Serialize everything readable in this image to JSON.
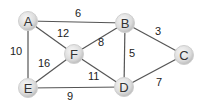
{
  "graph": {
    "title": "Weighted undirected graph",
    "nodes": [
      {
        "id": "A",
        "x": 28,
        "y": 21
      },
      {
        "id": "B",
        "x": 125,
        "y": 23
      },
      {
        "id": "C",
        "x": 184,
        "y": 55
      },
      {
        "id": "D",
        "x": 124,
        "y": 87
      },
      {
        "id": "E",
        "x": 28,
        "y": 88
      },
      {
        "id": "F",
        "x": 74,
        "y": 54
      }
    ],
    "edges": [
      {
        "from": "A",
        "to": "B",
        "weight": "6",
        "lx": 75,
        "ly": 17
      },
      {
        "from": "A",
        "to": "F",
        "weight": "12",
        "lx": 57,
        "ly": 37
      },
      {
        "from": "A",
        "to": "E",
        "weight": "10",
        "lx": 10,
        "ly": 55
      },
      {
        "from": "B",
        "to": "F",
        "weight": "8",
        "lx": 98,
        "ly": 46
      },
      {
        "from": "B",
        "to": "C",
        "weight": "3",
        "lx": 155,
        "ly": 35
      },
      {
        "from": "B",
        "to": "D",
        "weight": "5",
        "lx": 129,
        "ly": 57
      },
      {
        "from": "F",
        "to": "E",
        "weight": "16",
        "lx": 38,
        "ly": 67
      },
      {
        "from": "F",
        "to": "D",
        "weight": "11",
        "lx": 88,
        "ly": 80
      },
      {
        "from": "E",
        "to": "D",
        "weight": "9",
        "lx": 67,
        "ly": 100
      },
      {
        "from": "D",
        "to": "C",
        "weight": "7",
        "lx": 156,
        "ly": 86
      }
    ]
  },
  "colors": {
    "edge": "#555555",
    "node_fill_light": "#f4f4f4",
    "node_fill_dark": "#c8c8c8",
    "label": "#333333"
  }
}
